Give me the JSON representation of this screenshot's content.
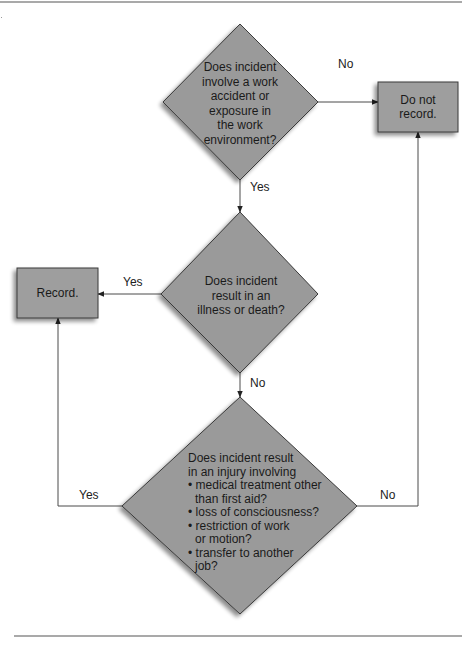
{
  "colors": {
    "shape_fill": "#9a9a9a",
    "shape_stroke": "#3a3a3a",
    "line": "#4a4a4a",
    "background": "#ffffff"
  },
  "flowchart": {
    "decision1": {
      "lines": [
        "Does incident",
        "involve a work",
        "accident or",
        "exposure in",
        "the work",
        "environment?"
      ]
    },
    "decision2": {
      "lines": [
        "Does incident",
        "result in an",
        "illness or death?"
      ]
    },
    "decision3": {
      "intro": [
        "Does incident result",
        "in an injury involving"
      ],
      "bullets": [
        [
          "medical treatment other",
          "than first aid?"
        ],
        [
          "loss of consciousness?"
        ],
        [
          "restriction of work",
          "or motion?"
        ],
        [
          "transfer to another",
          "job?"
        ]
      ]
    },
    "outcome_do_not_record": {
      "lines": [
        "Do not",
        "record."
      ]
    },
    "outcome_record": {
      "lines": [
        "Record."
      ]
    },
    "edges": {
      "d1_no": "No",
      "d1_yes": "Yes",
      "d2_yes": "Yes",
      "d2_no": "No",
      "d3_yes": "Yes",
      "d3_no": "No"
    }
  }
}
